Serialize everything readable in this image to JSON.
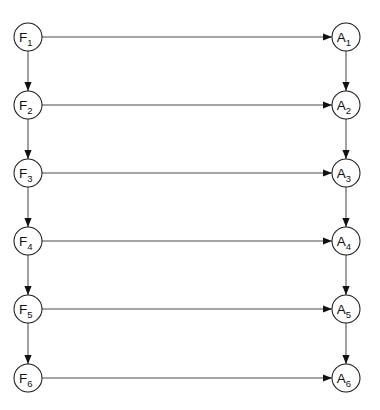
{
  "diagram": {
    "background_color": "#ffffff",
    "node_fill": "#ffffff",
    "node_stroke": "#1a1a1a",
    "edge_color": "#4d4d4d",
    "arrow_color": "#111111",
    "geometry": {
      "width": 380,
      "height": 410,
      "node_radius": 14,
      "left_column_x": 28,
      "right_column_x": 346,
      "row_y": [
        37,
        105,
        173,
        241,
        309,
        378
      ],
      "row_spacing": 68
    },
    "columns": [
      {
        "name": "F-column",
        "position": "left",
        "cx": 28,
        "nodes": [
          {
            "id": "F1",
            "base": "F",
            "sub": "1",
            "label": "F1",
            "cy": 37
          },
          {
            "id": "F2",
            "base": "F",
            "sub": "2",
            "label": "F2",
            "cy": 105
          },
          {
            "id": "F3",
            "base": "F",
            "sub": "3",
            "label": "F3",
            "cy": 173
          },
          {
            "id": "F4",
            "base": "F",
            "sub": "4",
            "label": "F4",
            "cy": 241
          },
          {
            "id": "F5",
            "base": "F",
            "sub": "5",
            "label": "F5",
            "cy": 309
          },
          {
            "id": "F6",
            "base": "F",
            "sub": "6",
            "label": "F6",
            "cy": 378
          }
        ]
      },
      {
        "name": "A-column",
        "position": "right",
        "cx": 346,
        "nodes": [
          {
            "id": "A1",
            "base": "A",
            "sub": "1",
            "label": "A1",
            "cy": 37
          },
          {
            "id": "A2",
            "base": "A",
            "sub": "2",
            "label": "A2",
            "cy": 105
          },
          {
            "id": "A3",
            "base": "A",
            "sub": "3",
            "label": "A3",
            "cy": 173
          },
          {
            "id": "A4",
            "base": "A",
            "sub": "4",
            "label": "A4",
            "cy": 241
          },
          {
            "id": "A5",
            "base": "A",
            "sub": "5",
            "label": "A5",
            "cy": 309
          },
          {
            "id": "A6",
            "base": "A",
            "sub": "6",
            "label": "A6",
            "cy": 378
          }
        ]
      }
    ],
    "edges": {
      "horizontal": [
        {
          "from": "F1",
          "to": "A1",
          "y": 37
        },
        {
          "from": "F2",
          "to": "A2",
          "y": 105
        },
        {
          "from": "F3",
          "to": "A3",
          "y": 173
        },
        {
          "from": "F4",
          "to": "A4",
          "y": 241
        },
        {
          "from": "F5",
          "to": "A5",
          "y": 309
        },
        {
          "from": "F6",
          "to": "A6",
          "y": 378
        }
      ],
      "vertical_left": [
        {
          "from": "F1",
          "to": "F2",
          "x": 28
        },
        {
          "from": "F2",
          "to": "F3",
          "x": 28
        },
        {
          "from": "F3",
          "to": "F4",
          "x": 28
        },
        {
          "from": "F4",
          "to": "F5",
          "x": 28
        },
        {
          "from": "F5",
          "to": "F6",
          "x": 28
        }
      ],
      "vertical_right": [
        {
          "from": "A1",
          "to": "A2",
          "x": 346
        },
        {
          "from": "A2",
          "to": "A3",
          "x": 346
        },
        {
          "from": "A3",
          "to": "A4",
          "x": 346
        },
        {
          "from": "A4",
          "to": "A5",
          "x": 346
        },
        {
          "from": "A5",
          "to": "A6",
          "x": 346
        }
      ]
    }
  }
}
